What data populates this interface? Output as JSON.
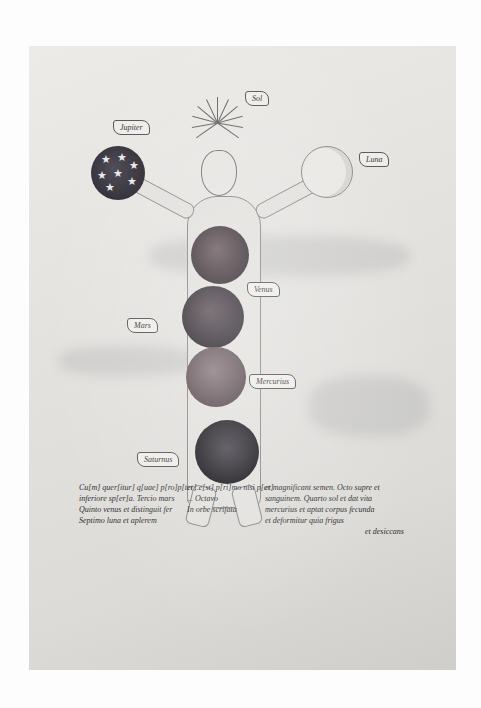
{
  "manuscript": {
    "labels": {
      "jupiter": "Jupiter",
      "sol": "Sol",
      "luna": "Luna",
      "venus": "Venus",
      "mars": "Mars",
      "mercurius": "Mercurius",
      "saturnus": "Saturnus"
    },
    "text": {
      "left": [
        "Cu[m] quer[itur] q[uae] p[ro]p[ter] e[st] p[ri]mo nisi p[er]",
        "inferiore sp[er]a. Tercio mars",
        "Quinto venus et distinguit fer",
        "Septimo luna et aplerem"
      ],
      "middle": [
        "",
        "et ...",
        "... Octavo",
        "In orbe scrifata"
      ],
      "right": [
        "et magnificant semen. Octo supre et",
        "sanguinem. Quarto sol et dat vita",
        "mercurius et aptat corpus fecunda",
        "et deformitur quia frigus",
        "et desiccans"
      ]
    }
  },
  "colors": {
    "parchment": "#e3e2df",
    "ink": "#2a2a2a",
    "sphere_dark": "#2a2730",
    "background": "#fdfdfd"
  }
}
